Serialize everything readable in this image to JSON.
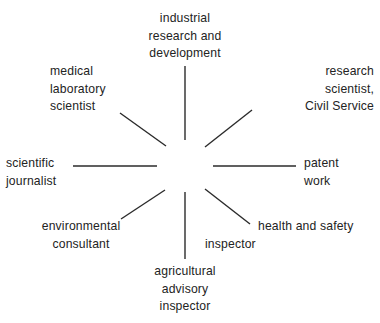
{
  "diagram": {
    "type": "radial-spoke",
    "title": "",
    "background_color": "#ffffff",
    "line_color": "#2b2b2b",
    "text_color": "#232323",
    "center": {
      "x": 185,
      "y": 167
    },
    "spoke_count": 8,
    "labels": {
      "industrial": "industrial\nresearch and\ndevelopment",
      "research_civil_service": "research\nscientist,\nCivil Service",
      "medical_laboratory": "medical\nlaboratory\nscientist",
      "patent_work": "patent\nwork",
      "scientific_journalist": "scientific\njournalist",
      "environmental_consultant": "environmental\nconsultant",
      "health_and_safety": "health and safety",
      "health_and_safety_inspector": "inspector",
      "agricultural_advisory_inspector": "agricultural\nadvisory\ninspector"
    },
    "spokes": [
      {
        "name": "spoke-north",
        "x1": 185,
        "y1": 140,
        "x2": 185,
        "y2": 66
      },
      {
        "name": "spoke-northeast",
        "x1": 205,
        "y1": 147,
        "x2": 252,
        "y2": 110
      },
      {
        "name": "spoke-east",
        "x1": 213,
        "y1": 166,
        "x2": 296,
        "y2": 166
      },
      {
        "name": "spoke-southeast",
        "x1": 205,
        "y1": 189,
        "x2": 250,
        "y2": 224
      },
      {
        "name": "spoke-south",
        "x1": 185,
        "y1": 192,
        "x2": 185,
        "y2": 259
      },
      {
        "name": "spoke-southwest",
        "x1": 165,
        "y1": 190,
        "x2": 121,
        "y2": 219
      },
      {
        "name": "spoke-west",
        "x1": 157,
        "y1": 166,
        "x2": 73,
        "y2": 166
      },
      {
        "name": "spoke-northwest",
        "x1": 166,
        "y1": 146,
        "x2": 120,
        "y2": 113
      }
    ]
  }
}
